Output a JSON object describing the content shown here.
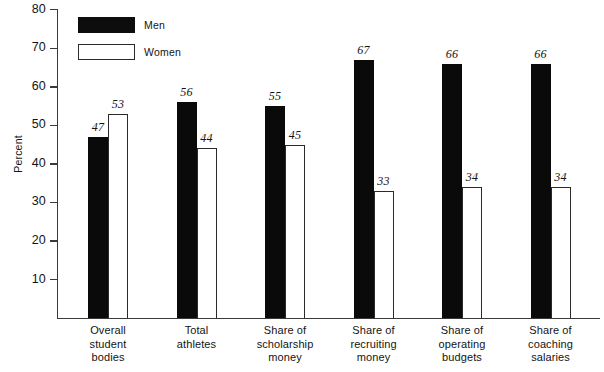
{
  "chart_data": {
    "type": "bar",
    "title": "",
    "subtitle": "",
    "xlabel": "",
    "ylabel": "Percent",
    "ylim": [
      0,
      85
    ],
    "yticks": [
      10,
      20,
      30,
      40,
      50,
      60,
      70,
      80
    ],
    "ytick_labels": [
      "10",
      "20",
      "30",
      "40",
      "50",
      "60",
      "70",
      "80"
    ],
    "grid": false,
    "legend_position": "top-left",
    "categories": [
      "Overall student bodies",
      "Total athletes",
      "Share of scholarship money",
      "Share of recruiting money",
      "Share of operating budgets",
      "Share of coaching salaries"
    ],
    "category_lines": [
      [
        "Overall",
        "student",
        "bodies"
      ],
      [
        "Total",
        "athletes"
      ],
      [
        "Share of",
        "scholarship",
        "money"
      ],
      [
        "Share of",
        "recruiting",
        "money"
      ],
      [
        "Share of",
        "operating",
        "budgets"
      ],
      [
        "Share of",
        "coaching",
        "salaries"
      ]
    ],
    "series": [
      {
        "name": "Men",
        "color": "#0a0a0a",
        "style": "filled",
        "values": [
          47,
          56,
          55,
          67,
          66,
          66
        ],
        "labels": [
          "47",
          "56",
          "55",
          "67",
          "66",
          "66"
        ]
      },
      {
        "name": "Women",
        "color": "#ffffff",
        "style": "outlined",
        "values": [
          53,
          44,
          45,
          33,
          34,
          34
        ],
        "labels": [
          "53",
          "44",
          "45",
          "33",
          "34",
          "34"
        ]
      }
    ]
  },
  "legend": {
    "items": [
      {
        "label": "Men"
      },
      {
        "label": "Women"
      }
    ]
  },
  "axis": {
    "y_title": "Percent"
  }
}
